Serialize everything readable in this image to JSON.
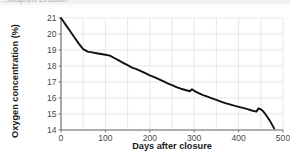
{
  "page": {
    "caption_fragment": "...mosphere Emission:"
  },
  "chart_data": {
    "type": "line",
    "title": "",
    "xlabel": "Days after closure",
    "ylabel": "Oxygen concentration (%)",
    "xlim": [
      0,
      500
    ],
    "ylim": [
      14,
      21
    ],
    "xticks": [
      0,
      100,
      200,
      300,
      400,
      500
    ],
    "yticks": [
      14,
      15,
      16,
      17,
      18,
      19,
      20,
      21
    ],
    "grid": true,
    "grid_x_step": 50,
    "grid_y_step": 1,
    "legend": "none",
    "line_color": "#111111",
    "series": [
      {
        "name": "Oxygen concentration",
        "x": [
          0,
          10,
          20,
          30,
          40,
          50,
          60,
          70,
          80,
          90,
          100,
          110,
          120,
          130,
          140,
          150,
          160,
          170,
          180,
          190,
          200,
          210,
          220,
          230,
          240,
          250,
          260,
          270,
          280,
          290,
          295,
          300,
          310,
          320,
          330,
          340,
          350,
          360,
          370,
          380,
          390,
          400,
          410,
          420,
          430,
          440,
          445,
          450,
          455,
          460,
          465,
          470,
          475,
          480
        ],
        "y": [
          21.0,
          20.6,
          20.2,
          19.8,
          19.4,
          19.05,
          18.9,
          18.85,
          18.8,
          18.75,
          18.7,
          18.65,
          18.5,
          18.35,
          18.2,
          18.05,
          17.9,
          17.8,
          17.68,
          17.55,
          17.42,
          17.3,
          17.18,
          17.05,
          16.92,
          16.8,
          16.68,
          16.58,
          16.5,
          16.42,
          16.55,
          16.45,
          16.3,
          16.18,
          16.08,
          15.98,
          15.88,
          15.78,
          15.68,
          15.6,
          15.52,
          15.45,
          15.38,
          15.3,
          15.22,
          15.15,
          15.35,
          15.3,
          15.18,
          15.0,
          14.8,
          14.6,
          14.35,
          14.1
        ]
      }
    ]
  }
}
